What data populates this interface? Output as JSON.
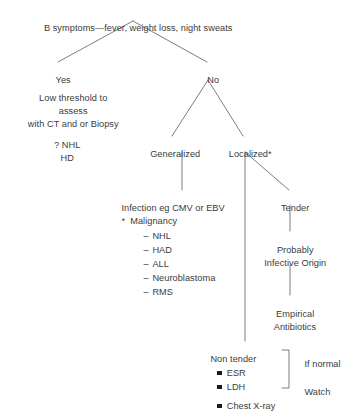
{
  "diagram": {
    "title": "B symptoms—fever, weight loss, night sweats",
    "root": {
      "label": "B symptoms—fever, weight loss, night sweats"
    },
    "branches": {
      "yes": "Yes",
      "no": "No"
    },
    "yes_branch": {
      "line1": "Low threshold to",
      "line2": "assess",
      "line3": "with CT and or Biopsy",
      "line4": "? NHL",
      "line5": "HD"
    },
    "no_branch": {
      "generalized": "Generalized",
      "localized": "Localized*"
    },
    "generalized_branch": {
      "infection": "Infection eg CMV or EBV",
      "malignancy": "*  Malignancy",
      "malignancy_items": [
        "NHL",
        "HAD",
        "ALL",
        "Neuroblastoma",
        "RMS"
      ]
    },
    "localized_branch": {
      "tender": "Tender",
      "probably_line1": "Probably",
      "probably_line2": "Infective Origin",
      "empirical_line1": "Empirical",
      "empirical_line2": "Antibiotics",
      "non_tender": "Non tender",
      "tests": [
        "ESR",
        "LDH",
        "Chest X-ray"
      ],
      "outcome_if_normal": "If normal",
      "outcome_watch": "Watch"
    }
  },
  "colors": {
    "text": "#3b3b3b",
    "line": "#6e6e6e",
    "bullet": "#1a1a1a",
    "background": "#ffffff"
  }
}
